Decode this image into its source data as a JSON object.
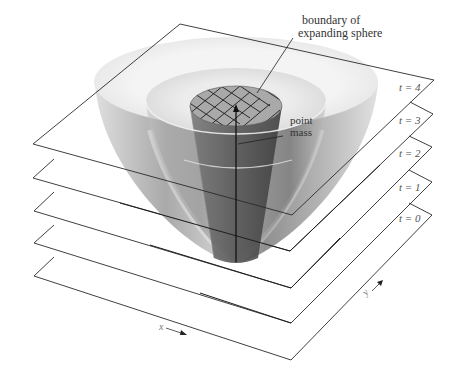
{
  "figure": {
    "annotations": {
      "boundary_line1": "boundary of",
      "boundary_line2": "expanding sphere",
      "point_line1": "point",
      "point_line2": "mass"
    },
    "time_slices": [
      {
        "label": "t = 0",
        "left": [
          34,
          276
        ],
        "top": [
          178,
          192
        ],
        "right": [
          432,
          215
        ],
        "bottom": [
          291,
          360
        ]
      },
      {
        "label": "t = 1",
        "left": [
          34,
          243
        ],
        "top": [
          178,
          159
        ],
        "right": [
          432,
          182
        ],
        "bottom": [
          291,
          323
        ]
      },
      {
        "label": "t = 2",
        "left": [
          34,
          211
        ],
        "top": [
          179,
          126
        ],
        "right": [
          432,
          147
        ],
        "bottom": [
          291,
          288
        ]
      },
      {
        "label": "t = 3",
        "left": [
          33,
          178
        ],
        "top": [
          180,
          92
        ],
        "right": [
          433,
          114
        ],
        "bottom": [
          290,
          251
        ]
      },
      {
        "label": "t = 4",
        "left": [
          33,
          144
        ],
        "top": [
          180,
          24
        ],
        "right": [
          434,
          80
        ],
        "bottom": [
          292,
          215
        ]
      }
    ],
    "axes": {
      "x_label": "x",
      "y_label": "y"
    },
    "colors": {
      "line": "#2a2a2a",
      "bowl_light": "#e8e8e8",
      "bowl_mid": "#b5b5b5",
      "bowl_dark": "#6a6a6a",
      "cylinder": "#5e5e5e",
      "grid_top": "#9a9a9a"
    }
  }
}
